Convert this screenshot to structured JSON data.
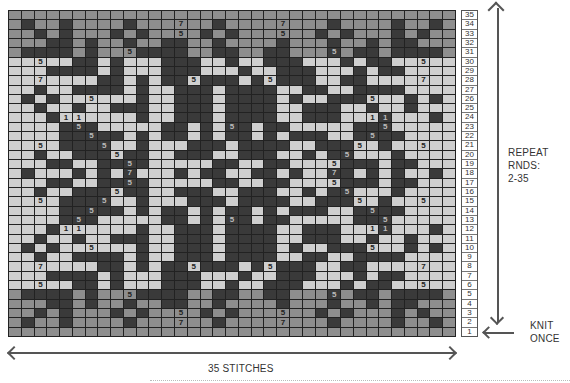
{
  "chart_data": {
    "type": "heatmap",
    "columns": 35,
    "rows": 35,
    "legend": {
      "M": "medium gray",
      "D": "dark charcoal",
      "L": "light gray"
    },
    "colors": {
      "M": "#8e8e8e",
      "D": "#3a3a3a",
      "L": "#cfcfcf",
      "grid": "#222222"
    },
    "grid_rows_top_to_bottom": [
      "MMMMMMMMMMMMMMMMMMMMMMMMMMMMMMMMMMM",
      "MDMMDMMMMDMMMMMMDMMMMMMMMDMMMMDMMDM",
      "MMDMDMMMDMDMMMMDMDMMMMMMDMDMMMDMDMM",
      "MMMDDMDMMDMMDDMMDMMMMDMMMDMMDMDDMMM",
      "MDDDDMDMMMDDDDMMDDMMDDMMMDMDDMDDDDM",
      "LLLLLDDLDLLLDDDLLDLLDDDLLLDLDDLLLLL",
      "LLLDDDDLDLLLDDDLLLDLLDDDLLLDLDDLLLL",
      "LLLLLLLDDLDLDDLDDDLDLDDDLLDDLLLLLLL",
      "LLDLLDDDDLDLLDDDLDDDDLLDDLLDDDDLLLL",
      "LDLDLLLLLLDLLDDDLDDDDLDLLDDDLLLDLDL",
      "LLDLLDLLDDDLLDDDLDDDDLLDDDLLDLLDLLL",
      "LLLDLLLLLLDLLDDDLDDDDLLDDDLLLDLLLDL",
      "LLLLDDDLLLLLDDLDLDDLDDLLLLLDDDLLLLL",
      "LLLLDDDDDLDLDDLDLDDLDLDDDLLDDDDLLLL",
      "LLLLDDDDLLDLLLDDDLDDDDLLDDDLLDLLLLL",
      "LLDLLDDDLDDLLDDDLLDDDLLDLDDLLLDLLLL",
      "LLLDDLLDDDDLLLLLDDLLDDLLLLDDDLDDLLL",
      "LDLLLDLDLDLLLDLDDLLDDLDLLDDLDLDLLDL",
      "LLLDDLLDDDDLLLLLDDLLDDLLLLDDDLDDLLL",
      "LLDLLDDDLDDLLDDDLLDDDLLDLDDLLLDLLLL",
      "LLLLDDDDLLDLLLDDDLDDDDLLDDDLLDLLLLL",
      "LLLLDDDDDLDLDDLDLDDLDLDDDLLDDDDLLLL",
      "LLLLDDDLLLLLDDLDLDDLDDLLLLLDDDLLLLL",
      "LLLDLLLLLLDLLDDDLDDDDLLDDDLLLDLLLDL",
      "LLDLLDLLDDDLLDDDLDDDDLLDDDLLDLLDLLL",
      "LDLDLLLLLLDLLDDDLDDDDLDLLDDDLLLDLDL",
      "LLDLLDDDDLDLLDDDLDDDDLLDDLLDDDDLLLL",
      "LLLLLLLDDLDLDDLDDDLDLDDDLLDDLLLLLLL",
      "LLLDDDDLDLLLDDDLLLDLLDDDLLLDLDDLLLL",
      "LLLLLDDLDLLLDDDLLDLLDDDLLLDLDDLLLLL",
      "MDDDDMDMMMDDDDMMDDMMDDMMMDMDDMDDDDM",
      "MMMDDMDMMDMMDDMMDMMMMDMMMDMMDMDDMMM",
      "MMDMDMMMDMDMMMMDMDMMMMMMDMDMMMDMDMM",
      "MDMMDMMMMDMMMMMMDMMMMMMMMDMMMMDMMDM",
      "MMMMMMMMMMMMMMMMMMMMMMMMMMMMMMMMMMM"
    ],
    "symbols": [
      {
        "row": 34,
        "col": 14,
        "text": "7"
      },
      {
        "row": 34,
        "col": 22,
        "text": "7"
      },
      {
        "row": 33,
        "col": 14,
        "text": "5"
      },
      {
        "row": 33,
        "col": 22,
        "text": "5"
      },
      {
        "row": 31,
        "col": 10,
        "text": "5"
      },
      {
        "row": 31,
        "col": 26,
        "text": "5"
      },
      {
        "row": 30,
        "col": 3,
        "text": "5"
      },
      {
        "row": 30,
        "col": 33,
        "text": "5"
      },
      {
        "row": 28,
        "col": 3,
        "text": "7"
      },
      {
        "row": 28,
        "col": 15,
        "text": "5"
      },
      {
        "row": 28,
        "col": 21,
        "text": "5"
      },
      {
        "row": 28,
        "col": 33,
        "text": "7"
      },
      {
        "row": 26,
        "col": 7,
        "text": "5"
      },
      {
        "row": 26,
        "col": 29,
        "text": "5"
      },
      {
        "row": 24,
        "col": 5,
        "text": "1"
      },
      {
        "row": 24,
        "col": 6,
        "text": "1"
      },
      {
        "row": 24,
        "col": 29,
        "text": "1"
      },
      {
        "row": 24,
        "col": 30,
        "text": "1"
      },
      {
        "row": 23,
        "col": 6,
        "text": "5"
      },
      {
        "row": 23,
        "col": 18,
        "text": "5"
      },
      {
        "row": 23,
        "col": 30,
        "text": "5"
      },
      {
        "row": 22,
        "col": 7,
        "text": "5"
      },
      {
        "row": 22,
        "col": 29,
        "text": "5"
      },
      {
        "row": 21,
        "col": 3,
        "text": "5"
      },
      {
        "row": 21,
        "col": 8,
        "text": "5"
      },
      {
        "row": 21,
        "col": 28,
        "text": "5"
      },
      {
        "row": 21,
        "col": 33,
        "text": "5"
      },
      {
        "row": 20,
        "col": 9,
        "text": "5"
      },
      {
        "row": 20,
        "col": 27,
        "text": "5"
      },
      {
        "row": 19,
        "col": 10,
        "text": "5"
      },
      {
        "row": 19,
        "col": 26,
        "text": "5"
      },
      {
        "row": 18,
        "col": 10,
        "text": "7"
      },
      {
        "row": 18,
        "col": 26,
        "text": "7"
      },
      {
        "row": 17,
        "col": 10,
        "text": "5"
      },
      {
        "row": 17,
        "col": 26,
        "text": "5"
      },
      {
        "row": 16,
        "col": 9,
        "text": "5"
      },
      {
        "row": 16,
        "col": 27,
        "text": "5"
      },
      {
        "row": 15,
        "col": 3,
        "text": "5"
      },
      {
        "row": 15,
        "col": 8,
        "text": "5"
      },
      {
        "row": 15,
        "col": 28,
        "text": "5"
      },
      {
        "row": 15,
        "col": 33,
        "text": "5"
      },
      {
        "row": 14,
        "col": 7,
        "text": "5"
      },
      {
        "row": 14,
        "col": 29,
        "text": "5"
      },
      {
        "row": 13,
        "col": 6,
        "text": "5"
      },
      {
        "row": 13,
        "col": 18,
        "text": "5"
      },
      {
        "row": 13,
        "col": 30,
        "text": "5"
      },
      {
        "row": 12,
        "col": 5,
        "text": "1"
      },
      {
        "row": 12,
        "col": 6,
        "text": "1"
      },
      {
        "row": 12,
        "col": 29,
        "text": "1"
      },
      {
        "row": 12,
        "col": 30,
        "text": "1"
      },
      {
        "row": 10,
        "col": 7,
        "text": "5"
      },
      {
        "row": 10,
        "col": 29,
        "text": "5"
      },
      {
        "row": 8,
        "col": 3,
        "text": "7"
      },
      {
        "row": 8,
        "col": 15,
        "text": "5"
      },
      {
        "row": 8,
        "col": 21,
        "text": "5"
      },
      {
        "row": 8,
        "col": 33,
        "text": "7"
      },
      {
        "row": 6,
        "col": 3,
        "text": "5"
      },
      {
        "row": 6,
        "col": 33,
        "text": "5"
      },
      {
        "row": 5,
        "col": 10,
        "text": "5"
      },
      {
        "row": 5,
        "col": 26,
        "text": "5"
      },
      {
        "row": 3,
        "col": 14,
        "text": "5"
      },
      {
        "row": 3,
        "col": 22,
        "text": "5"
      },
      {
        "row": 2,
        "col": 14,
        "text": "7"
      },
      {
        "row": 2,
        "col": 22,
        "text": "7"
      }
    ],
    "row_numbers": [
      "35",
      "34",
      "33",
      "32",
      "31",
      "30",
      "29",
      "28",
      "27",
      "26",
      "25",
      "24",
      "23",
      "22",
      "21",
      "20",
      "19",
      "18",
      "17",
      "16",
      "15",
      "14",
      "13",
      "12",
      "11",
      "10",
      "9",
      "8",
      "7",
      "6",
      "5",
      "4",
      "3",
      "2",
      "1"
    ],
    "xlabel": "35 STITCHES"
  },
  "labels": {
    "repeat_line1": "REPEAT RNDS:",
    "repeat_line2": "2-35",
    "knit_line1": "KNIT",
    "knit_line2": "ONCE",
    "stitches": "35 STITCHES"
  }
}
